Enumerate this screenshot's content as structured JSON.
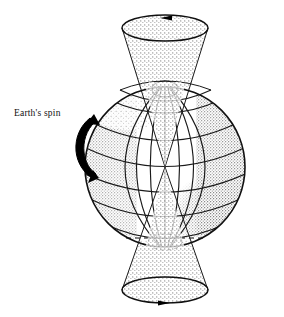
{
  "figure": {
    "title": "",
    "type": "scientific-illustration",
    "background_color": "#ffffff",
    "width": 284,
    "height": 317
  },
  "labels": {
    "spin": "Earth's spin"
  },
  "colors": {
    "ink": "#111111",
    "line": "#1a1a1a",
    "stipple": "#7a7a7a",
    "stipple_dark": "#555555",
    "arrow_solid": "#000000",
    "background": "#ffffff"
  },
  "globe": {
    "center_x": 165,
    "center_y": 167,
    "radius": 80,
    "latitude_count": 7,
    "longitude_count": 7,
    "pole_circle_north": true,
    "pole_circle_south_dashed": true,
    "shading": "stippled-limb"
  },
  "cones": {
    "axis_x": 165,
    "apex_y": 167,
    "top": {
      "mouth_cy": 28,
      "mouth_rx": 43,
      "mouth_ry": 13,
      "arrow_direction": "left",
      "arrow_label": ""
    },
    "bottom": {
      "mouth_cy": 290,
      "mouth_rx": 43,
      "mouth_ry": 13,
      "arrow_direction": "right",
      "arrow_label": ""
    }
  },
  "spin_arrow": {
    "direction": "counterclockwise-eastward",
    "style": "thick-solid-black-curved"
  }
}
